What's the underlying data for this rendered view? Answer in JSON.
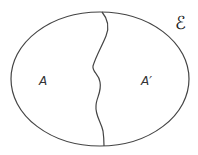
{
  "diagram": {
    "type": "venn",
    "universal_set_label": "ℰ",
    "regions": [
      {
        "label": "A"
      },
      {
        "label": "A′"
      }
    ],
    "colors": {
      "stroke": "#444444",
      "background": "#ffffff"
    }
  }
}
